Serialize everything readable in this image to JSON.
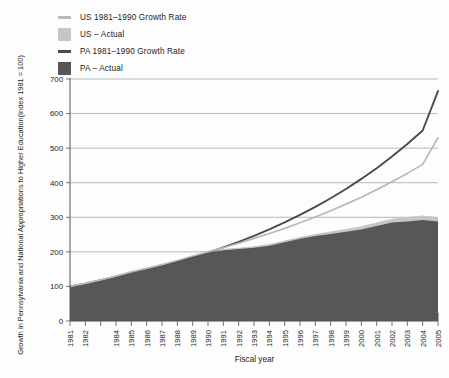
{
  "legend": {
    "items": [
      {
        "label": "US  1981–1990 Growth Rate",
        "marker": "line",
        "color": "#b9b9b9",
        "name": "legend-us-growth-rate"
      },
      {
        "label": "US – Actual",
        "marker": "box",
        "color": "#c6c6c6",
        "name": "legend-us-actual"
      },
      {
        "label": "PA  1981–1990 Growth Rate",
        "marker": "line",
        "color": "#4a4a4a",
        "name": "legend-pa-growth-rate"
      },
      {
        "label": "PA – Actual",
        "marker": "box",
        "color": "#575757",
        "name": "legend-pa-actual"
      }
    ]
  },
  "chart_data": {
    "type": "area",
    "title": "",
    "xlabel": "Fiscal year",
    "ylabel": "Growth in Pennsylvania and National Appropriations to Higher Education(Index 1981 = 100)",
    "ylim": [
      0,
      700
    ],
    "ytick_step": 100,
    "yticks": [
      0,
      100,
      200,
      300,
      400,
      500,
      600,
      700
    ],
    "grid": true,
    "legend_position": "top-left",
    "x": [
      1981,
      1982,
      1983,
      1984,
      1985,
      1986,
      1987,
      1988,
      1989,
      1990,
      1991,
      1992,
      1993,
      1994,
      1995,
      1996,
      1997,
      1998,
      1999,
      2000,
      2001,
      2002,
      2003,
      2004,
      2005
    ],
    "xtick_labels": [
      "1981",
      "1982",
      "",
      "1984",
      "1985",
      "1986",
      "1987",
      "1988",
      "1989",
      "1990",
      "1991",
      "1992",
      "1993",
      "1994",
      "1995",
      "1996",
      "1997",
      "1998",
      "1999",
      "2000",
      "2001",
      "2002",
      "2003",
      "2004",
      "2005"
    ],
    "series": [
      {
        "name": "PA – Actual",
        "kind": "area",
        "color": "#575757",
        "values": [
          100,
          108,
          118,
          128,
          140,
          150,
          160,
          172,
          185,
          198,
          205,
          208,
          212,
          218,
          228,
          238,
          246,
          252,
          258,
          265,
          275,
          285,
          288,
          292,
          288
        ]
      },
      {
        "name": "US – Actual",
        "kind": "area",
        "color": "#c6c6c6",
        "values": [
          100,
          109,
          119,
          130,
          142,
          152,
          163,
          175,
          188,
          200,
          208,
          212,
          216,
          223,
          233,
          243,
          252,
          259,
          266,
          274,
          285,
          296,
          301,
          305,
          300
        ]
      },
      {
        "name": "PA  1981–1990 Growth Rate",
        "kind": "line",
        "color": "#4a4a4a",
        "values": [
          100,
          108,
          118,
          128,
          140,
          150,
          160,
          172,
          185,
          198,
          213,
          229,
          246,
          265,
          285,
          307,
          330,
          355,
          382,
          411,
          442,
          476,
          512,
          551,
          665
        ]
      },
      {
        "name": "US  1981–1990 Growth Rate",
        "kind": "line",
        "color": "#b9b9b9",
        "values": [
          100,
          109,
          119,
          130,
          142,
          152,
          163,
          175,
          188,
          200,
          212,
          225,
          239,
          253,
          268,
          284,
          301,
          319,
          338,
          358,
          380,
          403,
          427,
          453,
          530
        ]
      }
    ]
  }
}
